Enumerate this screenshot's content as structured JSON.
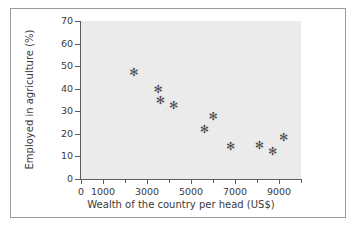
{
  "chart_data": {
    "type": "scatter",
    "title": "",
    "xlabel": "Wealth of the country per head (US$)",
    "ylabel": "Employed in agriculture (%)",
    "xlim": [
      0,
      10000
    ],
    "ylim": [
      0,
      70
    ],
    "grid": false,
    "legend": "none",
    "marker": "asterisk",
    "marker_color": "#4a4a4a",
    "plot_background": "#ebebeb",
    "axis_color": "#5d5d5d",
    "x_ticks": [
      {
        "value": 0,
        "label": "0",
        "major": true
      },
      {
        "value": 1000,
        "label": "1000",
        "major": true
      },
      {
        "value": 2000,
        "label": "",
        "major": false
      },
      {
        "value": 3000,
        "label": "3000",
        "major": true
      },
      {
        "value": 4000,
        "label": "",
        "major": false
      },
      {
        "value": 5000,
        "label": "5000",
        "major": true
      },
      {
        "value": 6000,
        "label": "",
        "major": false
      },
      {
        "value": 7000,
        "label": "7000",
        "major": true
      },
      {
        "value": 8000,
        "label": "",
        "major": false
      },
      {
        "value": 9000,
        "label": "9000",
        "major": true
      },
      {
        "value": 10000,
        "label": "",
        "major": false
      }
    ],
    "y_ticks": [
      {
        "value": 0,
        "label": "0"
      },
      {
        "value": 10,
        "label": "10"
      },
      {
        "value": 20,
        "label": "20"
      },
      {
        "value": 30,
        "label": "30"
      },
      {
        "value": 40,
        "label": "40"
      },
      {
        "value": 50,
        "label": "50"
      },
      {
        "value": 60,
        "label": "60"
      },
      {
        "value": 70,
        "label": "70"
      }
    ],
    "points": [
      {
        "x": 2400,
        "y": 47.0
      },
      {
        "x": 3500,
        "y": 39.5
      },
      {
        "x": 3600,
        "y": 35.0
      },
      {
        "x": 4200,
        "y": 32.5
      },
      {
        "x": 5600,
        "y": 22.0
      },
      {
        "x": 6000,
        "y": 27.5
      },
      {
        "x": 6800,
        "y": 14.5
      },
      {
        "x": 8100,
        "y": 15.0
      },
      {
        "x": 8700,
        "y": 12.0
      },
      {
        "x": 9200,
        "y": 18.5
      }
    ],
    "marker_glyph": "✻"
  }
}
